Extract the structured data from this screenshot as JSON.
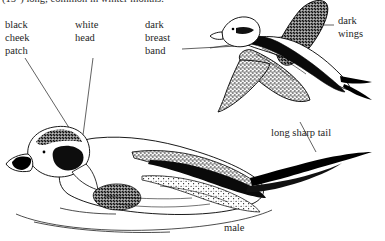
{
  "figure": {
    "caption_top": "(15\") long; common in winter months.",
    "background_color": "#ffffff",
    "ink_color": "#000000"
  },
  "labels": {
    "cheek_patch": "black\ncheek\npatch",
    "white_head": "white\nhead",
    "breast_band": "dark\nbreast\nband",
    "dark_wings": "dark\nwings",
    "long_tail": "long sharp tail",
    "sex": "male"
  },
  "icons": {
    "flying_duck": "flying-duck-illustration",
    "swimming_duck": "swimming-duck-illustration",
    "water_line": "water-surface-line"
  }
}
